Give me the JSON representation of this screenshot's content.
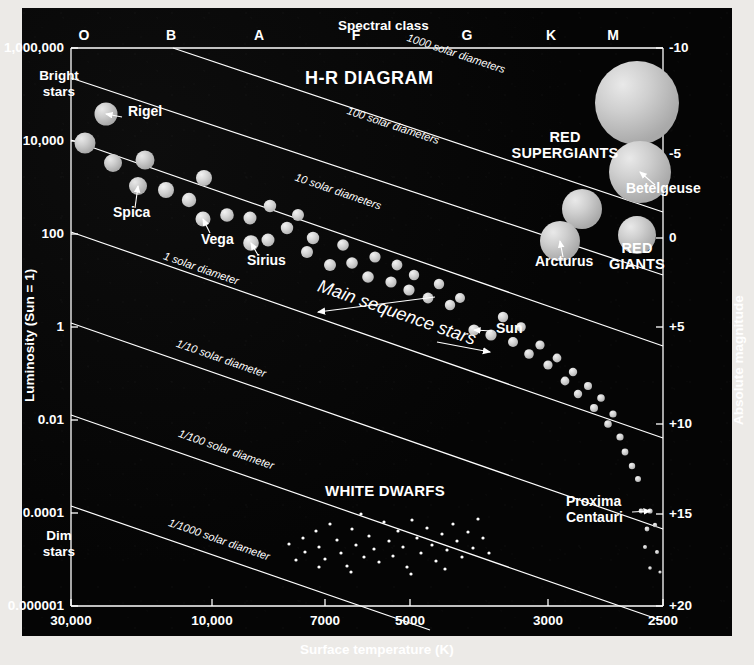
{
  "figure": {
    "title": "H-R DIAGRAM",
    "top_axis_title": "Spectral class",
    "bottom_axis_title": "Surface temperature (K)",
    "left_axis_title": "Luminosity (Sun = 1)",
    "right_axis_title": "Absolute magnitude",
    "bright_label": "Bright\nstars",
    "bright_label_l1": "Bright",
    "bright_label_l2": "stars",
    "dim_label_l1": "Dim",
    "dim_label_l2": "stars",
    "background_color": "#050505",
    "ink_color": "#ffffff",
    "star_color": "#c9c9c9"
  },
  "groups": [
    {
      "id": "red-supergiants",
      "line1": "RED",
      "line2": "SUPERGIANTS",
      "x": 565,
      "y": 138
    },
    {
      "id": "red-giants",
      "line1": "RED",
      "line2": "GIANTS",
      "x": 637,
      "y": 249
    },
    {
      "id": "white-dwarfs",
      "line1": "WHITE DWARFS",
      "line2": "",
      "x": 385,
      "y": 492
    },
    {
      "id": "main-sequence",
      "line1": "Main sequence stars",
      "line2": "",
      "x": 395,
      "y": 318
    }
  ],
  "spectral_classes": [
    {
      "label": "O",
      "x": 84
    },
    {
      "label": "B",
      "x": 171
    },
    {
      "label": "A",
      "x": 259
    },
    {
      "label": "F",
      "x": 356
    },
    {
      "label": "G",
      "x": 467
    },
    {
      "label": "K",
      "x": 551
    },
    {
      "label": "M",
      "x": 613
    }
  ],
  "x_ticks": [
    {
      "label": "30,000",
      "x": 71
    },
    {
      "label": "10,000",
      "x": 212
    },
    {
      "label": "7000",
      "x": 325
    },
    {
      "label": "5000",
      "x": 410
    },
    {
      "label": "3000",
      "x": 548
    },
    {
      "label": "2500",
      "x": 663
    }
  ],
  "y_ticks": [
    {
      "label": "1,000,000",
      "y": 48
    },
    {
      "label": "10,000",
      "y": 141
    },
    {
      "label": "100",
      "y": 234
    },
    {
      "label": "1",
      "y": 327
    },
    {
      "label": "0.01",
      "y": 420
    },
    {
      "label": "0.0001",
      "y": 513
    },
    {
      "label": "0.000001",
      "y": 606
    }
  ],
  "right_ticks": [
    {
      "label": "-10",
      "y": 48
    },
    {
      "label": "-5",
      "y": 154
    },
    {
      "label": "0",
      "y": 238
    },
    {
      "label": "+5",
      "y": 327
    },
    {
      "label": "+10",
      "y": 424
    },
    {
      "label": "+15",
      "y": 514
    },
    {
      "label": "+20",
      "y": 606
    }
  ],
  "radius_lines": [
    {
      "label": "1000 solar diameters",
      "x1": 173,
      "y1": 48,
      "x2": 663,
      "y2": 212,
      "lx": 455,
      "ly": 57
    },
    {
      "label": "100 solar diameters",
      "x1": 71,
      "y1": 78,
      "x2": 663,
      "y2": 275,
      "lx": 392,
      "ly": 129
    },
    {
      "label": "10 solar diameters",
      "x1": 71,
      "y1": 140,
      "x2": 663,
      "y2": 346,
      "lx": 337,
      "ly": 195
    },
    {
      "label": "1 solar diameter",
      "x1": 71,
      "y1": 232,
      "x2": 663,
      "y2": 438,
      "lx": 200,
      "ly": 272
    },
    {
      "label": "1/10 solar diameter",
      "x1": 71,
      "y1": 323,
      "x2": 663,
      "y2": 529,
      "lx": 220,
      "ly": 362
    },
    {
      "label": "1/100 solar diameter",
      "x1": 71,
      "y1": 415,
      "x2": 663,
      "y2": 621,
      "lx": 225,
      "ly": 453
    },
    {
      "label": "1/1000 solar diameter",
      "x1": 71,
      "y1": 506,
      "x2": 430,
      "y2": 630,
      "lx": 218,
      "ly": 543
    }
  ],
  "named_stars": [
    {
      "name": "Rigel",
      "lx": 128,
      "ly": 113,
      "ax1": 122,
      "ay1": 117,
      "ax2": 106,
      "ay2": 114,
      "anchor": "left"
    },
    {
      "name": "Spica",
      "lx": 113,
      "ly": 214,
      "ax1": 135,
      "ay1": 208,
      "ax2": 138,
      "ay2": 186,
      "anchor": "left"
    },
    {
      "name": "Vega",
      "lx": 201,
      "ly": 241,
      "ax1": 210,
      "ay1": 233,
      "ax2": 203,
      "ay2": 219,
      "anchor": "left"
    },
    {
      "name": "Sirius",
      "lx": 247,
      "ly": 262,
      "ax1": 258,
      "ay1": 255,
      "ax2": 251,
      "ay2": 243,
      "anchor": "left"
    },
    {
      "name": "Sun",
      "lx": 496,
      "ly": 330,
      "ax1": 492,
      "ay1": 331,
      "ax2": 474,
      "ay2": 330,
      "anchor": "left"
    },
    {
      "name": "Arcturus",
      "lx": 535,
      "ly": 263,
      "ax1": 563,
      "ay1": 257,
      "ax2": 560,
      "ay2": 241,
      "anchor": "left"
    },
    {
      "name": "Betelgeuse",
      "lx": 626,
      "ly": 190,
      "ax1": 655,
      "ay1": 185,
      "ax2": 640,
      "ay2": 172,
      "anchor": "left"
    },
    {
      "name": "Proxima Centauri",
      "nl1": "Proxima",
      "nl2": "Centauri",
      "lx": 566,
      "ly": 503,
      "ax1": 632,
      "ay1": 512,
      "ax2": 650,
      "ay2": 511,
      "anchor": "left"
    }
  ],
  "chart_data": {
    "type": "scatter",
    "title": "H-R DIAGRAM",
    "xlabel": "Surface temperature (K)",
    "ylabel": "Luminosity (Sun = 1)",
    "x2label": "Spectral class",
    "y2label": "Absolute magnitude",
    "xlim": [
      30000,
      2500
    ],
    "ylim": [
      1e-06,
      1000000.0
    ],
    "xscale": "log-reversed",
    "yscale": "log",
    "y2lim": [
      -10,
      20
    ],
    "grid": false,
    "legend": "none",
    "annotations": [
      "RED SUPERGIANTS",
      "RED GIANTS",
      "WHITE DWARFS",
      "Main sequence stars",
      "Bright stars",
      "Dim stars",
      "1000 solar diameters",
      "100 solar diameters",
      "10 solar diameters",
      "1 solar diameter",
      "1/10 solar diameter",
      "1/100 solar diameter",
      "1/1000 solar diameter"
    ],
    "series": [
      {
        "name": "Main sequence stars",
        "marker": "filled-circle",
        "color": "#c9c9c9",
        "points": [
          {
            "px": 106,
            "py": 114,
            "r": 11.5,
            "label": "Rigel"
          },
          {
            "px": 85,
            "py": 143,
            "r": 10.5
          },
          {
            "px": 113,
            "py": 163,
            "r": 9.0
          },
          {
            "px": 145,
            "py": 160,
            "r": 9.5
          },
          {
            "px": 138,
            "py": 186,
            "r": 9.0,
            "label": "Spica"
          },
          {
            "px": 166,
            "py": 190,
            "r": 8.0
          },
          {
            "px": 189,
            "py": 200,
            "r": 7.2
          },
          {
            "px": 204,
            "py": 178,
            "r": 8.0
          },
          {
            "px": 203,
            "py": 219,
            "r": 7.5,
            "label": "Vega"
          },
          {
            "px": 227,
            "py": 215,
            "r": 6.8
          },
          {
            "px": 251,
            "py": 243,
            "r": 7.8,
            "label": "Sirius"
          },
          {
            "px": 250,
            "py": 218,
            "r": 6.5
          },
          {
            "px": 270,
            "py": 206,
            "r": 6.2
          },
          {
            "px": 268,
            "py": 240,
            "r": 6.5
          },
          {
            "px": 287,
            "py": 228,
            "r": 6.2
          },
          {
            "px": 298,
            "py": 215,
            "r": 6.0
          },
          {
            "px": 313,
            "py": 238,
            "r": 6.2
          },
          {
            "px": 307,
            "py": 252,
            "r": 6.0
          },
          {
            "px": 330,
            "py": 265,
            "r": 6.0
          },
          {
            "px": 343,
            "py": 245,
            "r": 5.8
          },
          {
            "px": 352,
            "py": 263,
            "r": 5.8
          },
          {
            "px": 368,
            "py": 277,
            "r": 5.8
          },
          {
            "px": 375,
            "py": 257,
            "r": 5.6
          },
          {
            "px": 391,
            "py": 282,
            "r": 5.6
          },
          {
            "px": 397,
            "py": 265,
            "r": 5.4
          },
          {
            "px": 409,
            "py": 290,
            "r": 5.6
          },
          {
            "px": 414,
            "py": 275,
            "r": 5.2
          },
          {
            "px": 428,
            "py": 298,
            "r": 5.4
          },
          {
            "px": 439,
            "py": 284,
            "r": 5.2
          },
          {
            "px": 450,
            "py": 305,
            "r": 5.2
          },
          {
            "px": 460,
            "py": 298,
            "r": 5.0
          },
          {
            "px": 474,
            "py": 330,
            "r": 5.6,
            "label": "Sun"
          },
          {
            "px": 491,
            "py": 335,
            "r": 5.6
          },
          {
            "px": 503,
            "py": 317,
            "r": 5.2
          },
          {
            "px": 513,
            "py": 342,
            "r": 5.0
          },
          {
            "px": 521,
            "py": 327,
            "r": 4.8
          },
          {
            "px": 529,
            "py": 354,
            "r": 4.8
          },
          {
            "px": 540,
            "py": 345,
            "r": 4.6
          },
          {
            "px": 548,
            "py": 365,
            "r": 4.6
          },
          {
            "px": 557,
            "py": 358,
            "r": 4.4
          },
          {
            "px": 565,
            "py": 381,
            "r": 4.4
          },
          {
            "px": 573,
            "py": 372,
            "r": 4.2
          },
          {
            "px": 578,
            "py": 394,
            "r": 4.2
          },
          {
            "px": 588,
            "py": 386,
            "r": 4.0
          },
          {
            "px": 594,
            "py": 408,
            "r": 4.0
          },
          {
            "px": 601,
            "py": 398,
            "r": 3.8
          },
          {
            "px": 608,
            "py": 424,
            "r": 3.8
          },
          {
            "px": 613,
            "py": 414,
            "r": 3.6
          },
          {
            "px": 620,
            "py": 437,
            "r": 3.6
          },
          {
            "px": 625,
            "py": 452,
            "r": 3.4
          },
          {
            "px": 632,
            "py": 466,
            "r": 3.2
          },
          {
            "px": 638,
            "py": 479,
            "r": 3.0
          },
          {
            "px": 650,
            "py": 511,
            "r": 2.6,
            "label": "Proxima Centauri"
          },
          {
            "px": 641,
            "py": 511,
            "r": 2.4
          },
          {
            "px": 647,
            "py": 529,
            "r": 2.4
          },
          {
            "px": 655,
            "py": 525,
            "r": 2.2
          },
          {
            "px": 645,
            "py": 547,
            "r": 2.0
          },
          {
            "px": 657,
            "py": 552,
            "r": 2.0
          },
          {
            "px": 650,
            "py": 568,
            "r": 1.8
          },
          {
            "px": 660,
            "py": 572,
            "r": 1.6
          }
        ]
      },
      {
        "name": "Red supergiants",
        "marker": "filled-circle",
        "color": "#c4c4c4",
        "points": [
          {
            "px": 637,
            "py": 103,
            "r": 42
          },
          {
            "px": 640,
            "py": 172,
            "r": 31,
            "label": "Betelgeuse"
          }
        ]
      },
      {
        "name": "Red giants",
        "marker": "filled-circle",
        "color": "#c2c2c2",
        "points": [
          {
            "px": 582,
            "py": 209,
            "r": 20
          },
          {
            "px": 560,
            "py": 241,
            "r": 20,
            "label": "Arcturus"
          },
          {
            "px": 637,
            "py": 235,
            "r": 19
          }
        ]
      },
      {
        "name": "White dwarfs",
        "marker": "small-dot",
        "color": "#ffffff",
        "points": [
          {
            "px": 289,
            "py": 544,
            "r": 1.6
          },
          {
            "px": 303,
            "py": 538,
            "r": 1.6
          },
          {
            "px": 305,
            "py": 552,
            "r": 1.6
          },
          {
            "px": 316,
            "py": 531,
            "r": 1.6
          },
          {
            "px": 319,
            "py": 547,
            "r": 1.6
          },
          {
            "px": 325,
            "py": 559,
            "r": 1.6
          },
          {
            "px": 330,
            "py": 524,
            "r": 1.6
          },
          {
            "px": 337,
            "py": 540,
            "r": 1.6
          },
          {
            "px": 341,
            "py": 553,
            "r": 1.6
          },
          {
            "px": 347,
            "py": 566,
            "r": 1.6
          },
          {
            "px": 352,
            "py": 529,
            "r": 1.6
          },
          {
            "px": 356,
            "py": 545,
            "r": 1.6
          },
          {
            "px": 361,
            "py": 514,
            "r": 1.6
          },
          {
            "px": 364,
            "py": 557,
            "r": 1.6
          },
          {
            "px": 369,
            "py": 536,
            "r": 1.6
          },
          {
            "px": 374,
            "py": 549,
            "r": 1.6
          },
          {
            "px": 379,
            "py": 562,
            "r": 1.6
          },
          {
            "px": 384,
            "py": 522,
            "r": 1.6
          },
          {
            "px": 389,
            "py": 541,
            "r": 1.6
          },
          {
            "px": 393,
            "py": 556,
            "r": 1.6
          },
          {
            "px": 398,
            "py": 531,
            "r": 1.6
          },
          {
            "px": 403,
            "py": 547,
            "r": 1.6
          },
          {
            "px": 407,
            "py": 567,
            "r": 1.6
          },
          {
            "px": 412,
            "py": 520,
            "r": 1.6
          },
          {
            "px": 417,
            "py": 538,
            "r": 1.6
          },
          {
            "px": 421,
            "py": 553,
            "r": 1.6
          },
          {
            "px": 427,
            "py": 528,
            "r": 1.6
          },
          {
            "px": 432,
            "py": 545,
            "r": 1.6
          },
          {
            "px": 436,
            "py": 561,
            "r": 1.6
          },
          {
            "px": 442,
            "py": 534,
            "r": 1.6
          },
          {
            "px": 447,
            "py": 550,
            "r": 1.6
          },
          {
            "px": 453,
            "py": 524,
            "r": 1.6
          },
          {
            "px": 457,
            "py": 541,
            "r": 1.6
          },
          {
            "px": 462,
            "py": 557,
            "r": 1.6
          },
          {
            "px": 468,
            "py": 532,
            "r": 1.6
          },
          {
            "px": 473,
            "py": 548,
            "r": 1.6
          },
          {
            "px": 478,
            "py": 519,
            "r": 1.6
          },
          {
            "px": 483,
            "py": 538,
            "r": 1.6
          },
          {
            "px": 489,
            "py": 553,
            "r": 1.6
          },
          {
            "px": 319,
            "py": 567,
            "r": 1.6
          },
          {
            "px": 296,
            "py": 560,
            "r": 1.6
          },
          {
            "px": 351,
            "py": 572,
            "r": 1.6
          },
          {
            "px": 411,
            "py": 574,
            "r": 1.6
          },
          {
            "px": 445,
            "py": 569,
            "r": 1.6
          }
        ]
      }
    ]
  }
}
